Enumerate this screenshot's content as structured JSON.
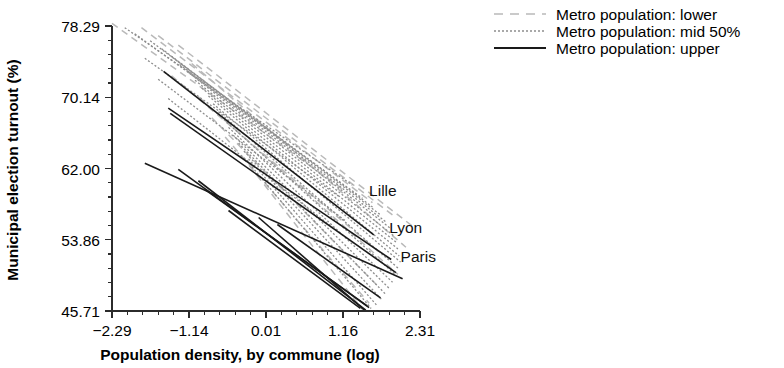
{
  "chart_data": {
    "type": "line",
    "title": "",
    "xlabel": "Population density, by commune (log)",
    "ylabel": "Municipal election turnout (%)",
    "xlim": [
      -2.29,
      2.31
    ],
    "ylim": [
      45.71,
      78.29
    ],
    "grid": false,
    "xticks": [
      "-2.29",
      "-1.14",
      "0.01",
      "1.16",
      "2.31"
    ],
    "xtick_values": [
      -2.29,
      -1.14,
      0.01,
      1.16,
      2.31
    ],
    "yticks": [
      "78.29",
      "70.14",
      "62.00",
      "53.86",
      "45.71"
    ],
    "ytick_values": [
      78.29,
      70.14,
      62.0,
      53.86,
      45.71
    ],
    "minor_ticks_per_interval": 4,
    "legend_position": "top-right-outside",
    "legend": [
      {
        "label": "Metro population: lower",
        "style": "dashed",
        "color": "#b9b9b9"
      },
      {
        "label": "Metro population: mid 50%",
        "style": "fine-dashed",
        "color": "#8d8d8d"
      },
      {
        "label": "Metro population: upper",
        "style": "solid",
        "color": "#1a1a1a"
      }
    ],
    "annotations": [
      {
        "text": "Lille",
        "x": 1.55,
        "y": 58.9
      },
      {
        "text": "Lyon",
        "x": 1.85,
        "y": 54.6
      },
      {
        "text": "Paris",
        "x": 2.02,
        "y": 51.3
      }
    ],
    "series": [
      {
        "name": "lower-1",
        "group": "lower",
        "x": [
          -2.29,
          1.16
        ],
        "y": [
          78.6,
          59.6
        ]
      },
      {
        "name": "lower-2",
        "group": "lower",
        "x": [
          -1.85,
          1.6
        ],
        "y": [
          78.1,
          58.1
        ]
      },
      {
        "name": "lower-3",
        "group": "lower",
        "x": [
          -1.6,
          1.95
        ],
        "y": [
          77.2,
          56.4
        ]
      },
      {
        "name": "lower-4",
        "group": "lower",
        "x": [
          -1.3,
          2.25
        ],
        "y": [
          76.1,
          55.1
        ]
      },
      {
        "name": "lower-5",
        "group": "lower",
        "x": [
          -1.1,
          2.1
        ],
        "y": [
          74.0,
          53.0
        ]
      },
      {
        "name": "lower-6",
        "group": "lower",
        "x": [
          -1.4,
          1.75
        ],
        "y": [
          72.6,
          52.1
        ]
      },
      {
        "name": "lower-7",
        "group": "lower",
        "x": [
          -1.0,
          1.98
        ],
        "y": [
          70.2,
          49.9
        ]
      },
      {
        "name": "lower-8",
        "group": "lower",
        "x": [
          -0.8,
          1.7
        ],
        "y": [
          67.8,
          48.4
        ]
      },
      {
        "name": "lower-9",
        "group": "lower",
        "x": [
          -0.6,
          1.55
        ],
        "y": [
          65.6,
          46.6
        ]
      },
      {
        "name": "lower-10",
        "group": "lower",
        "x": [
          -0.35,
          1.45
        ],
        "y": [
          63.4,
          45.9
        ]
      },
      {
        "name": "mid-1",
        "group": "mid",
        "x": [
          -2.1,
          1.3
        ],
        "y": [
          78.1,
          60.1
        ]
      },
      {
        "name": "mid-2",
        "group": "mid",
        "x": [
          -1.95,
          1.45
        ],
        "y": [
          77.4,
          58.6
        ]
      },
      {
        "name": "mid-3",
        "group": "mid",
        "x": [
          -1.72,
          1.6
        ],
        "y": [
          76.6,
          57.6
        ]
      },
      {
        "name": "mid-4",
        "group": "mid",
        "x": [
          -1.55,
          1.72
        ],
        "y": [
          75.7,
          56.7
        ]
      },
      {
        "name": "mid-5",
        "group": "mid",
        "x": [
          -1.4,
          1.8
        ],
        "y": [
          74.8,
          55.9
        ]
      },
      {
        "name": "mid-6",
        "group": "mid",
        "x": [
          -1.28,
          1.88
        ],
        "y": [
          73.9,
          55.1
        ]
      },
      {
        "name": "mid-7",
        "group": "mid",
        "x": [
          -1.15,
          1.92
        ],
        "y": [
          73.0,
          54.3
        ]
      },
      {
        "name": "mid-8",
        "group": "mid",
        "x": [
          -1.05,
          1.95
        ],
        "y": [
          72.1,
          53.6
        ]
      },
      {
        "name": "mid-9",
        "group": "mid",
        "x": [
          -0.95,
          1.98
        ],
        "y": [
          71.2,
          52.8
        ]
      },
      {
        "name": "mid-10",
        "group": "mid",
        "x": [
          -0.85,
          2.0
        ],
        "y": [
          70.3,
          52.0
        ]
      },
      {
        "name": "mid-11",
        "group": "mid",
        "x": [
          -0.78,
          2.02
        ],
        "y": [
          69.4,
          51.3
        ]
      },
      {
        "name": "mid-12",
        "group": "mid",
        "x": [
          -0.7,
          2.0
        ],
        "y": [
          68.5,
          50.5
        ]
      },
      {
        "name": "mid-13",
        "group": "mid",
        "x": [
          -0.62,
          1.95
        ],
        "y": [
          67.6,
          49.8
        ]
      },
      {
        "name": "mid-14",
        "group": "mid",
        "x": [
          -0.55,
          1.9
        ],
        "y": [
          66.7,
          49.0
        ]
      },
      {
        "name": "mid-15",
        "group": "mid",
        "x": [
          -0.48,
          1.85
        ],
        "y": [
          65.8,
          48.3
        ]
      },
      {
        "name": "mid-16",
        "group": "mid",
        "x": [
          -0.4,
          1.8
        ],
        "y": [
          64.9,
          47.6
        ]
      },
      {
        "name": "mid-17",
        "group": "mid",
        "x": [
          -0.32,
          1.74
        ],
        "y": [
          64.0,
          47.0
        ]
      },
      {
        "name": "mid-18",
        "group": "mid",
        "x": [
          -0.25,
          1.66
        ],
        "y": [
          63.1,
          46.4
        ]
      },
      {
        "name": "mid-19",
        "group": "mid",
        "x": [
          -1.6,
          1.2
        ],
        "y": [
          72.2,
          56.0
        ]
      },
      {
        "name": "mid-20",
        "group": "mid",
        "x": [
          -1.45,
          1.05
        ],
        "y": [
          70.0,
          55.0
        ]
      },
      {
        "name": "mid-21",
        "group": "mid",
        "x": [
          -0.2,
          1.58
        ],
        "y": [
          62.2,
          46.0
        ]
      },
      {
        "name": "mid-22",
        "group": "mid",
        "x": [
          -1.8,
          1.1
        ],
        "y": [
          74.6,
          58.8
        ]
      },
      {
        "name": "upper-1",
        "group": "upper",
        "x": [
          -1.52,
          1.62
        ],
        "y": [
          73.1,
          54.4
        ],
        "label": "Lille"
      },
      {
        "name": "upper-2",
        "group": "upper",
        "x": [
          -1.45,
          1.88
        ],
        "y": [
          68.9,
          51.6
        ],
        "label": "Lyon"
      },
      {
        "name": "upper-3",
        "group": "upper",
        "x": [
          -1.42,
          1.95
        ],
        "y": [
          68.3,
          50.1
        ]
      },
      {
        "name": "upper-4",
        "group": "upper",
        "x": [
          -1.8,
          2.05
        ],
        "y": [
          62.6,
          49.4
        ],
        "label": "Paris"
      },
      {
        "name": "upper-5",
        "group": "upper",
        "x": [
          -1.3,
          1.55
        ],
        "y": [
          61.9,
          46.1
        ]
      },
      {
        "name": "upper-6",
        "group": "upper",
        "x": [
          -1.0,
          1.5
        ],
        "y": [
          60.6,
          45.8
        ]
      },
      {
        "name": "upper-7",
        "group": "upper",
        "x": [
          -0.9,
          1.52
        ],
        "y": [
          59.6,
          46.3
        ]
      },
      {
        "name": "upper-8",
        "group": "upper",
        "x": [
          -0.55,
          1.42
        ],
        "y": [
          57.2,
          46.0
        ]
      },
      {
        "name": "upper-9",
        "group": "upper",
        "x": [
          0.18,
          1.72
        ],
        "y": [
          55.6,
          47.2
        ]
      },
      {
        "name": "upper-10",
        "group": "upper",
        "x": [
          -0.1,
          1.48
        ],
        "y": [
          56.4,
          45.8
        ]
      }
    ]
  },
  "colors": {
    "lower": "#b9b9b9",
    "mid": "#8d8d8d",
    "upper": "#1a1a1a",
    "axis": "#2b2b2b",
    "text": "#000000",
    "background": "#ffffff"
  }
}
